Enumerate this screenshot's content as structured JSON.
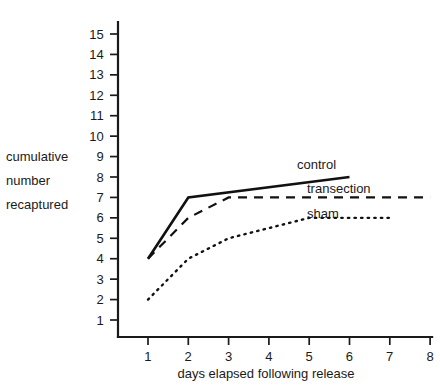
{
  "chart_data": {
    "type": "line",
    "title": "",
    "subtitle": "",
    "xlabel": "days elapsed following release",
    "ylabel": "cumulative number recaptured",
    "ylabel_lines": [
      "cumulative",
      "number",
      "recaptured"
    ],
    "x": [
      1,
      2,
      3,
      4,
      5,
      6,
      7,
      8
    ],
    "xticks": [
      "1",
      "2",
      "3",
      "4",
      "5",
      "6",
      "7",
      "8"
    ],
    "yticks": [
      "1",
      "2",
      "3",
      "4",
      "5",
      "6",
      "7",
      "8",
      "9",
      "10",
      "11",
      "12",
      "13",
      "14",
      "15"
    ],
    "xlim": [
      0.35,
      8.0
    ],
    "ylim": [
      0.2,
      15.6
    ],
    "grid": false,
    "legend_position": "inline-right",
    "series": [
      {
        "name": "control",
        "style": "solid",
        "color": "#111111",
        "x": [
          1,
          2,
          6
        ],
        "values": [
          4,
          7,
          8
        ],
        "label": "control"
      },
      {
        "name": "transection",
        "style": "dashed",
        "color": "#111111",
        "x": [
          1,
          2,
          3,
          8
        ],
        "values": [
          4,
          6,
          7,
          7
        ],
        "label": "transection"
      },
      {
        "name": "sham",
        "style": "dotted",
        "color": "#111111",
        "x": [
          1,
          2,
          3,
          4,
          5,
          7
        ],
        "values": [
          2,
          4,
          5,
          5.5,
          6,
          6
        ],
        "label": "sham"
      }
    ]
  },
  "axes": {
    "y_axis_name": "y-axis",
    "x_axis_name": "x-axis"
  },
  "colors": {
    "background": "#ffffff",
    "ink": "#1a1a1a",
    "line": "#111111"
  }
}
